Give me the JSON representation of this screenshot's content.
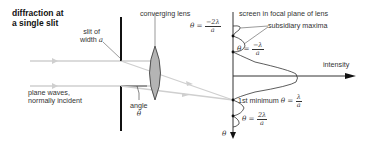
{
  "title": {
    "line1": "diffraction at",
    "line2": "a single slit"
  },
  "labels": {
    "converging_lens": "converging lens",
    "slit_line1": "slit of",
    "slit_line2_prefix": "width ",
    "slit_width_symbol": "a",
    "plane_waves_line1": "plane waves,",
    "plane_waves_line2": "normally incident",
    "angle_line1": "angle",
    "angle_symbol": "θ",
    "screen": "screen in focal plane of lens",
    "subsidiary_maxima": "subsidiary maxima",
    "intensity": "intensity",
    "first_minimum_prefix": "1st minimum ",
    "theta_axis": "θ"
  },
  "equations": {
    "theta_eq": "θ = ",
    "minus_two": {
      "num": "−2λ",
      "den": "a"
    },
    "minus_one": {
      "num": "−λ",
      "den": "a"
    },
    "plus_one": {
      "num": "λ",
      "den": "a"
    },
    "plus_two": {
      "num": "2λ",
      "den": "a"
    }
  },
  "colors": {
    "ray": "#c8c8c8",
    "lens_fill": "#b4b4b4",
    "barrier": "#111111",
    "line": "#333333"
  }
}
